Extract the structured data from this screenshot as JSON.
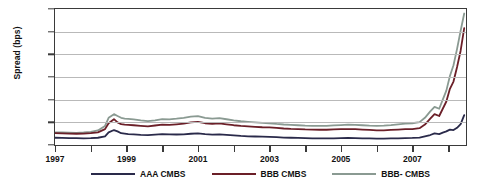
{
  "chart_data": {
    "type": "line",
    "title": "",
    "xlabel": "",
    "ylabel": "Spread (bps)",
    "ylim": [
      0,
      1500
    ],
    "yticks": [
      0,
      250,
      500,
      750,
      1000,
      1250,
      1500
    ],
    "ytick_labels": [
      "0",
      "250",
      "500",
      "750",
      "1000",
      "1250",
      "1500"
    ],
    "xlim": [
      1997.0,
      2008.5
    ],
    "xticks": [
      1997,
      1998,
      1999,
      2000,
      2001,
      2002,
      2003,
      2004,
      2005,
      2006,
      2007,
      2008
    ],
    "xtick_labels": [
      "1997",
      "",
      "1999",
      "",
      "2001",
      "",
      "2003",
      "",
      "2005",
      "",
      "2007",
      ""
    ],
    "grid": "horizontal",
    "legend_position": "bottom",
    "series": [
      {
        "name": "AAA CMBS",
        "color": "#2a2a4a",
        "x": [
          1997.0,
          1997.2,
          1997.4,
          1997.6,
          1997.8,
          1998.0,
          1998.2,
          1998.4,
          1998.5,
          1998.65,
          1998.75,
          1998.85,
          1998.95,
          1999.05,
          1999.2,
          1999.4,
          1999.6,
          1999.8,
          2000.0,
          2000.2,
          2000.4,
          2000.6,
          2000.8,
          2001.0,
          2001.2,
          2001.4,
          2001.6,
          2001.8,
          2002.0,
          2002.2,
          2002.4,
          2002.6,
          2002.8,
          2003.0,
          2003.2,
          2003.4,
          2003.6,
          2003.8,
          2004.0,
          2004.2,
          2004.4,
          2004.6,
          2004.8,
          2005.0,
          2005.2,
          2005.4,
          2005.6,
          2005.8,
          2006.0,
          2006.2,
          2006.4,
          2006.6,
          2006.8,
          2007.0,
          2007.2,
          2007.35,
          2007.5,
          2007.62,
          2007.75,
          2007.85,
          2007.95,
          2008.05,
          2008.15,
          2008.25,
          2008.35,
          2008.45
        ],
        "y": [
          80,
          78,
          76,
          75,
          74,
          76,
          80,
          95,
          140,
          165,
          150,
          130,
          125,
          120,
          118,
          112,
          108,
          115,
          120,
          118,
          116,
          118,
          124,
          128,
          120,
          115,
          118,
          112,
          106,
          100,
          96,
          94,
          92,
          90,
          86,
          82,
          80,
          78,
          76,
          74,
          72,
          72,
          74,
          76,
          78,
          76,
          74,
          72,
          70,
          70,
          72,
          74,
          76,
          78,
          82,
          96,
          110,
          128,
          120,
          136,
          150,
          170,
          165,
          190,
          230,
          330
        ]
      },
      {
        "name": "BBB CMBS",
        "color": "#6b1f28",
        "x": [
          1997.0,
          1997.2,
          1997.4,
          1997.6,
          1997.8,
          1998.0,
          1998.2,
          1998.4,
          1998.5,
          1998.65,
          1998.75,
          1998.85,
          1998.95,
          1999.05,
          1999.2,
          1999.4,
          1999.6,
          1999.8,
          2000.0,
          2000.2,
          2000.4,
          2000.6,
          2000.8,
          2001.0,
          2001.2,
          2001.4,
          2001.6,
          2001.8,
          2002.0,
          2002.2,
          2002.4,
          2002.6,
          2002.8,
          2003.0,
          2003.2,
          2003.4,
          2003.6,
          2003.8,
          2004.0,
          2004.2,
          2004.4,
          2004.6,
          2004.8,
          2005.0,
          2005.2,
          2005.4,
          2005.6,
          2005.8,
          2006.0,
          2006.2,
          2006.4,
          2006.6,
          2006.8,
          2007.0,
          2007.2,
          2007.35,
          2007.5,
          2007.62,
          2007.75,
          2007.85,
          2007.95,
          2008.05,
          2008.15,
          2008.25,
          2008.35,
          2008.45
        ],
        "y": [
          130,
          128,
          126,
          124,
          126,
          130,
          140,
          175,
          240,
          285,
          250,
          230,
          225,
          222,
          218,
          212,
          206,
          215,
          225,
          222,
          228,
          235,
          250,
          255,
          240,
          232,
          238,
          228,
          218,
          210,
          205,
          200,
          196,
          194,
          188,
          182,
          178,
          176,
          172,
          170,
          168,
          168,
          172,
          174,
          176,
          174,
          170,
          166,
          162,
          162,
          166,
          170,
          174,
          176,
          186,
          225,
          290,
          340,
          320,
          400,
          480,
          620,
          700,
          860,
          1040,
          1290
        ]
      },
      {
        "name": "BBB- CMBS",
        "color": "#8a9a92",
        "x": [
          1997.0,
          1997.2,
          1997.4,
          1997.6,
          1997.8,
          1998.0,
          1998.2,
          1998.4,
          1998.5,
          1998.65,
          1998.75,
          1998.85,
          1998.95,
          1999.05,
          1999.2,
          1999.4,
          1999.6,
          1999.8,
          2000.0,
          2000.2,
          2000.4,
          2000.6,
          2000.8,
          2001.0,
          2001.2,
          2001.4,
          2001.6,
          2001.8,
          2002.0,
          2002.2,
          2002.4,
          2002.6,
          2002.8,
          2003.0,
          2003.2,
          2003.4,
          2003.6,
          2003.8,
          2004.0,
          2004.2,
          2004.4,
          2004.6,
          2004.8,
          2005.0,
          2005.2,
          2005.4,
          2005.6,
          2005.8,
          2006.0,
          2006.2,
          2006.4,
          2006.6,
          2006.8,
          2007.0,
          2007.2,
          2007.35,
          2007.5,
          2007.62,
          2007.75,
          2007.85,
          2007.95,
          2008.05,
          2008.15,
          2008.25,
          2008.35,
          2008.45
        ],
        "y": [
          140,
          138,
          136,
          134,
          138,
          145,
          160,
          210,
          300,
          340,
          320,
          300,
          292,
          288,
          282,
          272,
          264,
          272,
          286,
          282,
          290,
          300,
          312,
          318,
          300,
          290,
          296,
          284,
          272,
          262,
          256,
          250,
          244,
          240,
          232,
          226,
          222,
          218,
          214,
          212,
          210,
          212,
          216,
          220,
          224,
          222,
          218,
          214,
          212,
          214,
          220,
          228,
          236,
          240,
          252,
          300,
          370,
          420,
          400,
          500,
          600,
          760,
          880,
          1060,
          1260,
          1450
        ]
      }
    ]
  },
  "legend": {
    "entries": [
      {
        "label": "AAA CMBS",
        "color": "#2a2a4a"
      },
      {
        "label": "BBB CMBS",
        "color": "#6b1f28"
      },
      {
        "label": "BBB- CMBS",
        "color": "#8a9a92"
      }
    ]
  }
}
